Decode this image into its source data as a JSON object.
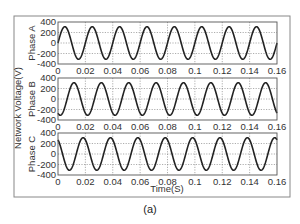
{
  "chart_data": {
    "type": "line",
    "caption": "(a)",
    "ylabel": "Network Voltage(V)",
    "xlabel": "Time(S)",
    "xlim": [
      0,
      0.16
    ],
    "ylim": [
      -400,
      400
    ],
    "x_ticks": [
      "0",
      "0.02",
      "0.04",
      "0.06",
      "0.08",
      "0.1",
      "0.12",
      "0.14",
      "0.16"
    ],
    "y_ticks": [
      "400",
      "200",
      "0",
      "-200",
      "-400"
    ],
    "grid": "dotted",
    "frequency_hz": 50,
    "amplitude_v": 311,
    "series": [
      {
        "name": "Phase A",
        "phase_deg": 0,
        "formula": "311*sin(2*pi*50*t)"
      },
      {
        "name": "Phase B",
        "phase_deg": -120,
        "formula": "311*sin(2*pi*50*t - 120deg)"
      },
      {
        "name": "Phase C",
        "phase_deg": 120,
        "formula": "311*sin(2*pi*50*t + 120deg)"
      }
    ]
  },
  "colors": {
    "frame": "#888888",
    "axes": "#555555",
    "grid": "#777777",
    "line": "#222222"
  }
}
